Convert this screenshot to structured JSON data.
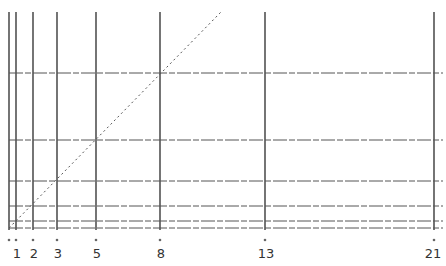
{
  "diagram": {
    "type": "fibonacci-grid",
    "sequence_labels": [
      "1",
      "2",
      "3",
      "5",
      "8",
      "13",
      "21"
    ],
    "label_positions": [
      {
        "label": "1",
        "x": 17
      },
      {
        "label": "2",
        "x": 34
      },
      {
        "label": "3",
        "x": 58
      },
      {
        "label": "5",
        "x": 97
      },
      {
        "label": "8",
        "x": 161
      },
      {
        "label": "13",
        "x": 266
      },
      {
        "label": "21",
        "x": 433
      }
    ],
    "vertical_lines_x": [
      9,
      16,
      33,
      57,
      96,
      160,
      265,
      434
    ],
    "horizontal_lines_y": [
      228,
      221,
      206,
      181,
      140,
      73
    ],
    "tick_dots_x": [
      9,
      16,
      33,
      57,
      96,
      160,
      265,
      434
    ],
    "tick_dots_y": 240,
    "origin": {
      "x": 9,
      "y": 228
    },
    "diagonal": {
      "x1": 9,
      "y1": 228,
      "x2": 221,
      "y2": 12
    },
    "colors": {
      "lines": "#2a2a2a",
      "grid_horizontal": "#555555",
      "background": "#ffffff"
    }
  }
}
